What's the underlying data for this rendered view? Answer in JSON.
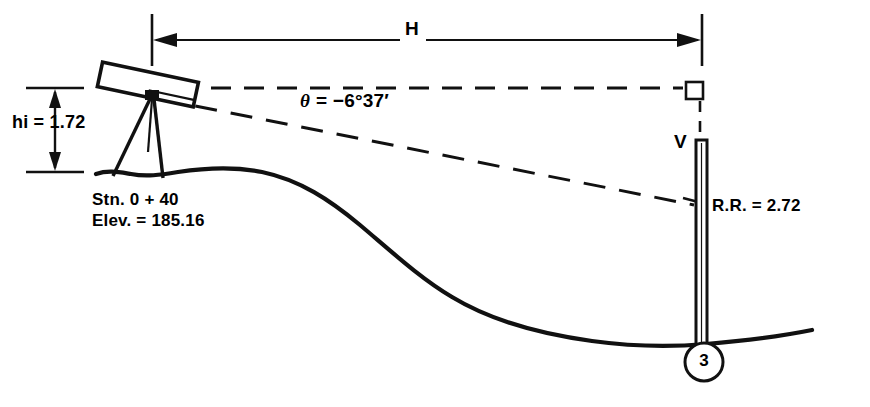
{
  "figure": {
    "type": "surveying-diagram",
    "ink_color": "#111111",
    "background_color": "#ffffff"
  },
  "labels": {
    "horizontal_distance": "H",
    "vertical_angle": "θ = −6°37′",
    "vertical_angle_symbol": "θ",
    "vertical_angle_value": "= −6°37′",
    "height_of_instrument": "hi = 1.72",
    "station": "Stn. 0 + 40",
    "elevation": "Elev. = 185.16",
    "vertical_distance": "V",
    "rod_reading": "R.R. = 2.72",
    "point_number": "3"
  },
  "icons": {
    "theodolite": "theodolite-icon",
    "tripod": "tripod-icon",
    "level-rod": "level-rod-icon",
    "right-angle": "right-angle-icon",
    "ground-profile": "ground-profile-icon",
    "dimension-arrow-left": "arrow-left-icon",
    "dimension-arrow-right": "arrow-right-icon",
    "hi-arrow-up": "arrow-up-icon",
    "hi-arrow-down": "arrow-down-icon",
    "point-circle": "circle-badge-icon"
  },
  "geometry": {
    "instrument_x": 152,
    "instrument_y": 96,
    "rod_x": 702,
    "dimension_line_y": 40,
    "horizontal_sight_y": 88,
    "ground_baseline_y": 172,
    "hi_top_y": 88,
    "hi_bottom_y": 172
  }
}
